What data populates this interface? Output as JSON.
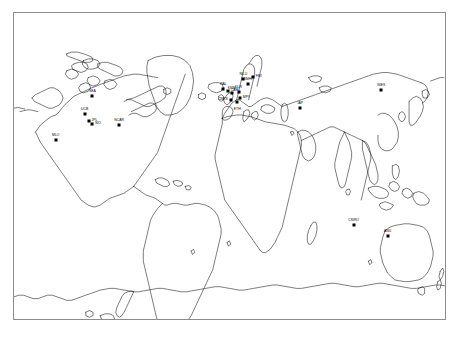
{
  "figure": {
    "projection": "equirectangular",
    "background_color": "#ffffff",
    "border_color": "#8c8c8c",
    "coastline_color": "#111111",
    "marker_color": "#000000",
    "width_px": 459,
    "height_px": 337
  },
  "frame": {
    "left_px": 13,
    "top_px": 12,
    "width_px": 433,
    "height_px": 308,
    "lon_min": -180,
    "lon_max": 180,
    "lat_min": -90,
    "lat_max": 90
  },
  "sites": [
    {
      "id": "site-pacific-nw",
      "label": "SEA",
      "x_pct": 18.2,
      "y_pct": 27.1,
      "label_pos": "above"
    },
    {
      "id": "site-california-1",
      "label": "UCB",
      "x_pct": 16.4,
      "y_pct": 33.1,
      "label_pos": "above"
    },
    {
      "id": "site-california-2",
      "label": "JPL",
      "x_pct": 17.3,
      "y_pct": 35.3,
      "label_pos": "right"
    },
    {
      "id": "site-california-3",
      "label": "SIO",
      "x_pct": 18.1,
      "y_pct": 36.4,
      "label_pos": "right"
    },
    {
      "id": "site-colorado",
      "label": "NCAR",
      "x_pct": 24.4,
      "y_pct": 36.6,
      "label_pos": "above"
    },
    {
      "id": "site-hawaii",
      "label": "MLO",
      "x_pct": 9.7,
      "y_pct": 41.4,
      "label_pos": "above"
    },
    {
      "id": "site-britain-1",
      "label": "RAL",
      "x_pct": 48.6,
      "y_pct": 24.7,
      "label_pos": "above"
    },
    {
      "id": "site-britain-2",
      "label": "CAM",
      "x_pct": 49.6,
      "y_pct": 25.6,
      "label_pos": "right"
    },
    {
      "id": "site-netherlands",
      "label": "KNMI",
      "x_pct": 50.6,
      "y_pct": 26.3,
      "label_pos": "above"
    },
    {
      "id": "site-germany-north",
      "label": "DLR",
      "x_pct": 52.1,
      "y_pct": 25.8,
      "label_pos": "above"
    },
    {
      "id": "site-germany-south",
      "label": "MPI",
      "x_pct": 52.4,
      "y_pct": 27.9,
      "label_pos": "right"
    },
    {
      "id": "site-france",
      "label": "CNRS",
      "x_pct": 50.3,
      "y_pct": 28.4,
      "label_pos": "left"
    },
    {
      "id": "site-scandinavia-1",
      "label": "NILU",
      "x_pct": 53.2,
      "y_pct": 21.5,
      "label_pos": "above"
    },
    {
      "id": "site-scandinavia-2",
      "label": "FMI",
      "x_pct": 55.4,
      "y_pct": 20.8,
      "label_pos": "right"
    },
    {
      "id": "site-baltic",
      "label": "SMHI",
      "x_pct": 54.3,
      "y_pct": 23.2,
      "label_pos": "above"
    },
    {
      "id": "site-alps",
      "label": "ETH",
      "x_pct": 51.8,
      "y_pct": 29.0,
      "label_pos": "below"
    },
    {
      "id": "site-central-asia",
      "label": "IAP",
      "x_pct": 66.4,
      "y_pct": 31.2,
      "label_pos": "above"
    },
    {
      "id": "site-japan",
      "label": "NIES",
      "x_pct": 85.2,
      "y_pct": 25.3,
      "label_pos": "above"
    },
    {
      "id": "site-australia-west",
      "label": "CSIRO",
      "x_pct": 78.8,
      "y_pct": 69.4,
      "label_pos": "above"
    },
    {
      "id": "site-australia-east",
      "label": "ANU",
      "x_pct": 86.7,
      "y_pct": 73.0,
      "label_pos": "above"
    }
  ]
}
